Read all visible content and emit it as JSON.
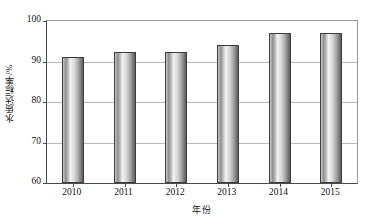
{
  "chart_data": {
    "type": "bar",
    "title": "",
    "subtitle": "",
    "xlabel": "年份",
    "ylabel": "水质达标率/%",
    "categories": [
      "2010",
      "2011",
      "2012",
      "2013",
      "2014",
      "2015"
    ],
    "values": [
      91.2,
      92.4,
      92.4,
      94.0,
      97.0,
      97.0
    ],
    "series": [
      {
        "name": "水质达标率",
        "values": [
          91.2,
          92.4,
          92.4,
          94.0,
          97.0,
          97.0
        ]
      }
    ],
    "ylim": [
      60,
      100
    ],
    "yticks": [
      60,
      70,
      80,
      90,
      100
    ],
    "ytick_labels": [
      "60",
      "70",
      "80",
      "90",
      "100"
    ],
    "xtick_labels": [
      "2010",
      "2011",
      "2012",
      "2013",
      "2014",
      "2015"
    ],
    "grid": true,
    "grid_axis": "y",
    "legend": false,
    "legend_position": "none",
    "bar_color": "#c0c0c0",
    "bar_edge_color": "#3d3d3d",
    "grid_color": "#b9b9b9",
    "axis_color": "#4a4a4a",
    "text_color": "#111111",
    "background_color": "#ffffff"
  }
}
